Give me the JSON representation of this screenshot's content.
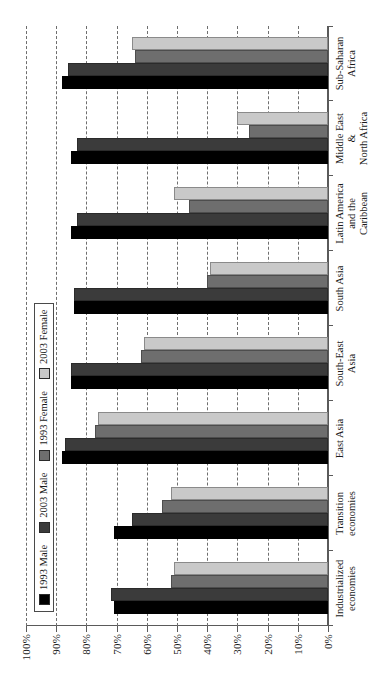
{
  "chart_data": {
    "type": "bar",
    "orientation": "horizontal-rotated",
    "title": "",
    "xlabel": "",
    "ylabel": "",
    "ylim": [
      0,
      100
    ],
    "ytick_labels": [
      "0%",
      "10%",
      "20%",
      "30%",
      "40%",
      "50%",
      "60%",
      "70%",
      "80%",
      "90%",
      "100%"
    ],
    "ytick_values": [
      0,
      10,
      20,
      30,
      40,
      50,
      60,
      70,
      80,
      90,
      100
    ],
    "grid": "dashed-horizontal",
    "legend_position": "upper-left-inside",
    "categories": [
      "Industrialized\neconomies",
      "Transition\neconomies",
      "East Asia",
      "South-East\nAsia",
      "South Asia",
      "Latin America\nand the\nCaribbean",
      "Middle East\n&\nNorth Africa",
      "Sub-Saharan\nAfrica"
    ],
    "series": [
      {
        "name": "1993 Male",
        "color": "#000000",
        "values": [
          71,
          71,
          88,
          85,
          84,
          85,
          85,
          88
        ]
      },
      {
        "name": "2003 Male",
        "color": "#3b3b3b",
        "values": [
          72,
          65,
          87,
          85,
          84,
          83,
          83,
          86
        ]
      },
      {
        "name": "1993 Female",
        "color": "#6e6e6e",
        "values": [
          52,
          55,
          77,
          62,
          40,
          46,
          26,
          64
        ]
      },
      {
        "name": "2003 Female",
        "color": "#c9c9c9",
        "values": [
          51,
          52,
          76,
          61,
          39,
          51,
          30,
          65
        ]
      }
    ]
  },
  "legend": {
    "items": [
      {
        "label": "1993 Male",
        "swatch": "s0"
      },
      {
        "label": "2003 Male",
        "swatch": "s1"
      },
      {
        "label": "1993 Female",
        "swatch": "s2"
      },
      {
        "label": "2003 Female",
        "swatch": "s3"
      }
    ]
  },
  "axis": {
    "labels": [
      "100%",
      "90%",
      "80%",
      "70%",
      "60%",
      "50%",
      "40%",
      "30%",
      "20%",
      "10%",
      "0%"
    ]
  }
}
